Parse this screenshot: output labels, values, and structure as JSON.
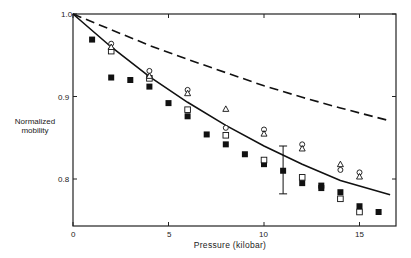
{
  "chart_data": {
    "type": "scatter",
    "title": "",
    "xlabel": "Pressure (kilobar)",
    "ylabel": "Normalized mobility",
    "xlim": [
      0,
      17
    ],
    "ylim": [
      0.743,
      1.0
    ],
    "xticks": [
      0,
      5,
      10,
      15
    ],
    "xtick_labels": [
      "0",
      "5",
      "10",
      "15"
    ],
    "yticks": [
      0.8,
      0.9,
      1.0
    ],
    "ytick_labels": [
      "0.8",
      "0.9",
      "1.0"
    ],
    "grid": false,
    "legend": null,
    "series": [
      {
        "name": "filled squares",
        "marker": "filled-square",
        "points": [
          [
            1,
            0.969
          ],
          [
            2,
            0.923
          ],
          [
            3,
            0.92
          ],
          [
            4,
            0.912
          ],
          [
            5,
            0.892
          ],
          [
            6,
            0.876
          ],
          [
            7,
            0.854
          ],
          [
            8,
            0.842
          ],
          [
            9,
            0.83
          ],
          [
            10,
            0.818
          ],
          [
            11,
            0.81
          ],
          [
            12,
            0.795
          ],
          [
            13,
            0.792
          ],
          [
            13,
            0.789
          ],
          [
            14,
            0.784
          ],
          [
            15,
            0.767
          ],
          [
            16,
            0.76
          ]
        ]
      },
      {
        "name": "open squares",
        "marker": "open-square",
        "points": [
          [
            2,
            0.955
          ],
          [
            4,
            0.922
          ],
          [
            6,
            0.884
          ],
          [
            8,
            0.853
          ],
          [
            10,
            0.823
          ],
          [
            12,
            0.802
          ],
          [
            14,
            0.776
          ],
          [
            15,
            0.76
          ]
        ]
      },
      {
        "name": "open circles",
        "marker": "open-circle",
        "points": [
          [
            2,
            0.964
          ],
          [
            4,
            0.931
          ],
          [
            6,
            0.908
          ],
          [
            8,
            0.862
          ],
          [
            10,
            0.86
          ],
          [
            12,
            0.842
          ],
          [
            14,
            0.811
          ],
          [
            15,
            0.808
          ]
        ]
      },
      {
        "name": "open triangles",
        "marker": "open-triangle",
        "points": [
          [
            2,
            0.96
          ],
          [
            4,
            0.925
          ],
          [
            6,
            0.904
          ],
          [
            8,
            0.885
          ],
          [
            10,
            0.855
          ],
          [
            12,
            0.837
          ],
          [
            14,
            0.818
          ],
          [
            15,
            0.803
          ]
        ]
      },
      {
        "name": "solid curve (theory)",
        "style": "solid-line",
        "points": [
          [
            0,
            1.0
          ],
          [
            2,
            0.96
          ],
          [
            4,
            0.924
          ],
          [
            6,
            0.893
          ],
          [
            8,
            0.865
          ],
          [
            10,
            0.84
          ],
          [
            12,
            0.818
          ],
          [
            14,
            0.798
          ],
          [
            16.6,
            0.781
          ]
        ]
      },
      {
        "name": "dashed curve",
        "style": "dashed-line",
        "points": [
          [
            0,
            1.0
          ],
          [
            2,
            0.981
          ],
          [
            4,
            0.962
          ],
          [
            6,
            0.945
          ],
          [
            8,
            0.929
          ],
          [
            10,
            0.913
          ],
          [
            12,
            0.899
          ],
          [
            14,
            0.886
          ],
          [
            16.5,
            0.871
          ]
        ]
      }
    ],
    "error_bars": [
      {
        "x": 11,
        "y": 0.81,
        "low": 0.782,
        "high": 0.84
      }
    ]
  },
  "axis": {
    "x_title": "Pressure (kilobar)",
    "y_title_line1": "Normalized",
    "y_title_line2": "mobility",
    "x_tick_labels": [
      "0",
      "5",
      "10",
      "15"
    ],
    "y_tick_labels": [
      "1.0",
      "0.9",
      "0.8"
    ]
  }
}
